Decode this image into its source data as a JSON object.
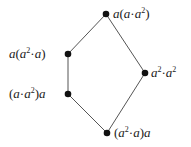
{
  "diagram": {
    "type": "hasse-diagram",
    "nodes": [
      {
        "id": "top",
        "label": "a(a·a²)",
        "x": 106,
        "y": 14
      },
      {
        "id": "left_upper",
        "label": "a(a²·a)",
        "x": 68,
        "y": 54
      },
      {
        "id": "left_lower",
        "label": "(a·a²)a",
        "x": 68,
        "y": 94
      },
      {
        "id": "right",
        "label": "a²·a²",
        "x": 145,
        "y": 73
      },
      {
        "id": "bottom",
        "label": "(a²·a)a",
        "x": 107,
        "y": 133
      }
    ],
    "edges": [
      [
        "top",
        "left_upper"
      ],
      [
        "left_upper",
        "left_lower"
      ],
      [
        "left_lower",
        "bottom"
      ],
      [
        "top",
        "right"
      ],
      [
        "right",
        "bottom"
      ]
    ],
    "colors": {
      "node": "#111111",
      "edge": "#555555",
      "text": "#222222"
    }
  }
}
